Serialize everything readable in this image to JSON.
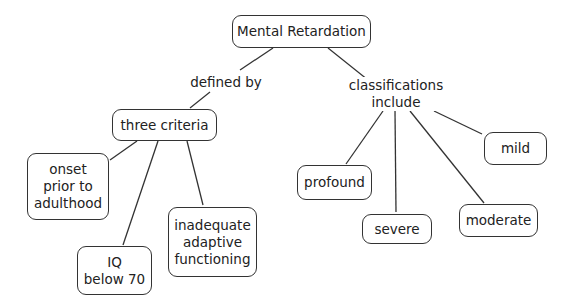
{
  "diagram": {
    "root": "Mental Retardation",
    "link_labels": {
      "defined_by": "defined by",
      "classifications": "classifications\ninclude"
    },
    "criteria": {
      "title": "three criteria",
      "items": [
        "onset\nprior to\nadulthood",
        "IQ\nbelow 70",
        "inadequate\nadaptive\nfunctioning"
      ]
    },
    "classifications": [
      "profound",
      "severe",
      "moderate",
      "mild"
    ]
  }
}
